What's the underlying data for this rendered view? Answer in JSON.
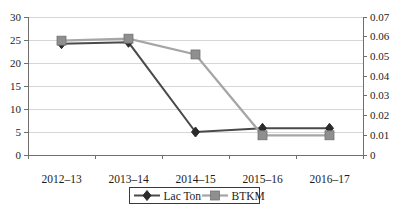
{
  "chart_data": {
    "type": "line",
    "title": "",
    "categories": [
      "2012–13",
      "2013–14",
      "2014–15",
      "2015–16",
      "2016–17"
    ],
    "series": [
      {
        "name": "Lac Ton",
        "axis": "left",
        "marker": "diamond",
        "values": [
          24.2,
          24.5,
          5.0,
          5.8,
          5.8
        ],
        "line_color": "#4a4a4a",
        "marker_color": "#2b2b2b"
      },
      {
        "name": "BTKM",
        "axis": "right",
        "marker": "square",
        "values": [
          0.058,
          0.059,
          0.051,
          0.01,
          0.01
        ],
        "line_color": "#a6a6a6",
        "marker_color": "#8f8f8f",
        "marker_border_color": "#6e6e6e"
      }
    ],
    "left_axis": {
      "min": 0,
      "max": 30,
      "ticks": [
        0,
        5,
        10,
        15,
        20,
        25,
        30
      ],
      "tick_labels": [
        "0",
        "5",
        "10",
        "15",
        "20",
        "25",
        "30"
      ]
    },
    "right_axis": {
      "min": 0,
      "max": 0.07,
      "ticks": [
        0,
        0.01,
        0.02,
        0.03,
        0.04,
        0.05,
        0.06,
        0.07
      ],
      "tick_labels": [
        "0",
        "0.01",
        "0.02",
        "0.03",
        "0.04",
        "0.05",
        "0.06",
        "0.07"
      ]
    },
    "grid": "horizontal-major",
    "gridline_color": "#d6d6d6",
    "axis_color": "#6f6f6f",
    "text_color": "#1c1c1c",
    "background": "#ffffff",
    "legend_position": "bottom"
  }
}
